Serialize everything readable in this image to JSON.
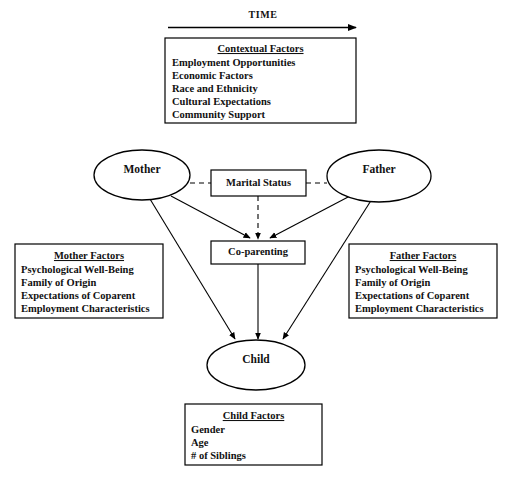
{
  "figure": {
    "timeline": {
      "label": "TIME",
      "arrow_direction": "right"
    },
    "nodes": {
      "mother": "Mother",
      "father": "Father",
      "child": "Child",
      "marital_status": "Marital Status",
      "coparenting": "Co-parenting"
    },
    "boxes": {
      "contextual": {
        "title": "Contextual Factors",
        "items": [
          "Employment Opportunities",
          "Economic Factors",
          "Race and Ethnicity",
          "Cultural Expectations",
          "Community Support"
        ]
      },
      "mother_factors": {
        "title": "Mother Factors",
        "items": [
          "Psychological Well-Being",
          "Family of Origin",
          "Expectations of Coparent",
          "Employment Characteristics"
        ]
      },
      "father_factors": {
        "title": "Father Factors",
        "items": [
          "Psychological Well-Being",
          "Family of Origin",
          "Expectations of Coparent",
          "Employment Characteristics"
        ]
      },
      "child_factors": {
        "title": "Child Factors",
        "items": [
          "Gender",
          "Age",
          "# of Siblings"
        ]
      }
    },
    "colors": {
      "ink": "#111111",
      "stroke": "#000000",
      "background": "#ffffff"
    }
  }
}
